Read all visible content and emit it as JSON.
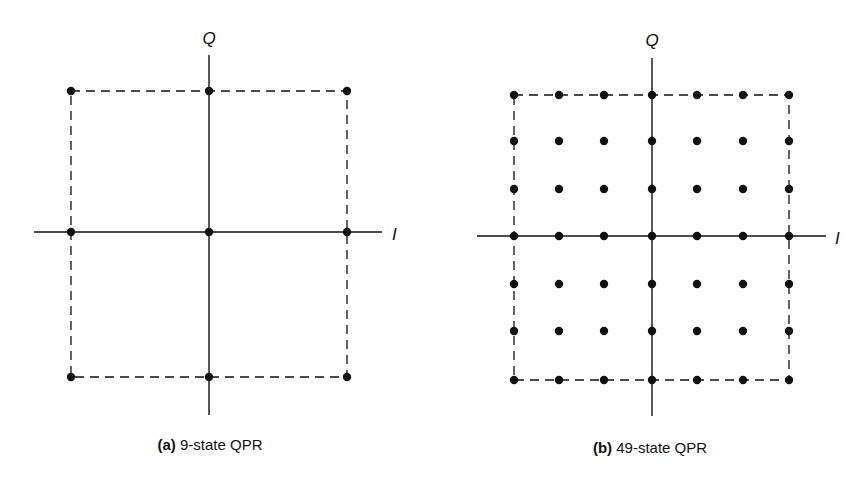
{
  "panels": [
    {
      "id": "a",
      "caption_letter": "(a)",
      "caption_text": " 9-state QPR",
      "axis_labels": {
        "vertical": "Q",
        "horizontal": "I"
      },
      "grid_size": 3,
      "x_positions": [
        71,
        209,
        347
      ],
      "y_positions": [
        91,
        232,
        377
      ],
      "center": [
        209,
        232
      ],
      "v_axis": [
        55,
        415
      ],
      "h_axis": [
        34,
        382
      ],
      "q_label_pos": [
        209,
        44
      ],
      "i_label_pos": [
        392,
        240
      ],
      "caption_pos": [
        210,
        436
      ]
    },
    {
      "id": "b",
      "caption_letter": "(b)",
      "caption_text": " 49-state QPR",
      "axis_labels": {
        "vertical": "Q",
        "horizontal": "I"
      },
      "grid_size": 7,
      "x_positions": [
        514,
        559,
        604,
        652,
        697,
        743,
        789
      ],
      "y_positions": [
        95,
        141,
        189,
        236,
        284,
        331,
        380
      ],
      "center": [
        652,
        236
      ],
      "v_axis": [
        58,
        416
      ],
      "h_axis": [
        477,
        826
      ],
      "q_label_pos": [
        652,
        46
      ],
      "i_label_pos": [
        835,
        244
      ],
      "caption_pos": [
        650,
        439
      ]
    }
  ],
  "colors": {
    "ink": "#111111",
    "background": "#ffffff"
  }
}
